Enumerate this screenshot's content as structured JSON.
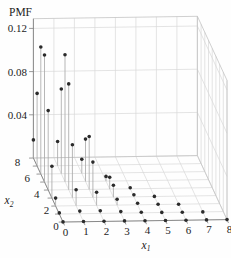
{
  "figure": {
    "background": "#fefefe",
    "zlabel": "PMF"
  },
  "colors": {
    "grid": "#d9d9d9",
    "axis": "#7f7f7f",
    "stem": "#aaaaaa",
    "dot": "#2b2b2b",
    "text": "#1c1c1c"
  },
  "chart_data": {
    "type": "stem3d",
    "title": "",
    "zlabel": "PMF",
    "x1_axis": {
      "label_base": "x",
      "label_sub": "1",
      "ticks": [
        0,
        1,
        2,
        3,
        4,
        5,
        6,
        7,
        8
      ],
      "tick_labels": [
        "0",
        "1",
        "2",
        "3",
        "4",
        "5",
        "6",
        "7",
        "8"
      ]
    },
    "x2_axis": {
      "label_base": "x",
      "label_sub": "2",
      "ticks": [
        0,
        1,
        2,
        3,
        4,
        5,
        6,
        7,
        8
      ],
      "labeled_ticks": [
        0,
        2,
        4,
        6,
        8
      ],
      "tick_labels": [
        "0",
        "2",
        "4",
        "6",
        "8"
      ]
    },
    "z_axis": {
      "tick_values": [
        0.04,
        0.08,
        0.12
      ],
      "tick_labels": [
        "0.04",
        "0.08",
        "0.12"
      ],
      "range": [
        0,
        0.129
      ]
    },
    "grid": true,
    "points": [
      [
        0,
        0,
        7e-05
      ],
      [
        0,
        1,
        0.00105
      ],
      [
        0,
        2,
        0.00735
      ],
      [
        0,
        3,
        0.02939
      ],
      [
        0,
        4,
        0.07348
      ],
      [
        0,
        5,
        0.11758
      ],
      [
        0,
        6,
        0.11758
      ],
      [
        0,
        7,
        0.06718
      ],
      [
        0,
        8,
        0.0168
      ],
      [
        1,
        0,
        0.00017
      ],
      [
        1,
        1,
        0.00245
      ],
      [
        1,
        2,
        0.0147
      ],
      [
        1,
        3,
        0.04899
      ],
      [
        1,
        4,
        0.09798
      ],
      [
        1,
        5,
        0.11758
      ],
      [
        1,
        6,
        0.07838
      ],
      [
        1,
        7,
        0.02239
      ],
      [
        2,
        0,
        0.0002
      ],
      [
        2,
        1,
        0.00245
      ],
      [
        2,
        2,
        0.01225
      ],
      [
        2,
        3,
        0.03266
      ],
      [
        2,
        4,
        0.04899
      ],
      [
        2,
        5,
        0.03919
      ],
      [
        2,
        6,
        0.01306
      ],
      [
        3,
        0,
        0.00014
      ],
      [
        3,
        1,
        0.00136
      ],
      [
        3,
        2,
        0.00544
      ],
      [
        3,
        3,
        0.01089
      ],
      [
        3,
        4,
        0.01089
      ],
      [
        3,
        5,
        0.00435
      ],
      [
        4,
        0,
        6e-05
      ],
      [
        4,
        1,
        0.00045
      ],
      [
        4,
        2,
        0.00136
      ],
      [
        4,
        3,
        0.00181
      ],
      [
        4,
        4,
        0.00091
      ],
      [
        5,
        0,
        2e-05
      ],
      [
        5,
        1,
        9e-05
      ],
      [
        5,
        2,
        0.00018
      ],
      [
        5,
        3,
        0.00012
      ],
      [
        6,
        0,
        0.0
      ],
      [
        6,
        1,
        1e-05
      ],
      [
        6,
        2,
        1e-05
      ],
      [
        7,
        0,
        0.0
      ],
      [
        7,
        1,
        0.0
      ],
      [
        8,
        0,
        0.0
      ]
    ]
  }
}
